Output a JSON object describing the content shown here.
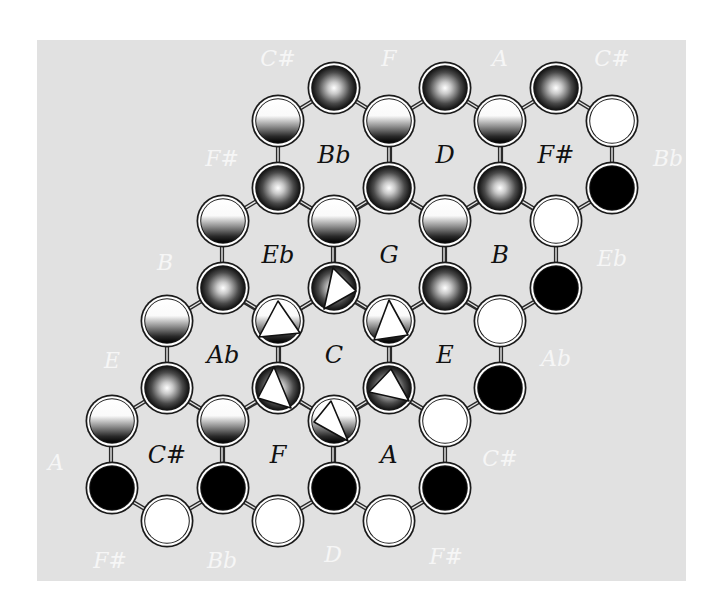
{
  "colors": {
    "panel_background": "#e1e1e1",
    "page_background": "#ffffff",
    "inner_label": "#111111",
    "outer_label": "#f6f6f6",
    "ball_outline": "#1a1a1a",
    "connector": "#2a2a2a"
  },
  "lattice": {
    "dx": 55.6,
    "dy_short": 33.5,
    "dy_long": 67,
    "ball_radius": 25
  },
  "cells": [
    {
      "label": "Bb",
      "x": 334,
      "y": 155
    },
    {
      "label": "D",
      "x": 445,
      "y": 155
    },
    {
      "label": "F#",
      "x": 556,
      "y": 155
    },
    {
      "label": "Eb",
      "x": 278,
      "y": 255
    },
    {
      "label": "G",
      "x": 389,
      "y": 255
    },
    {
      "label": "B",
      "x": 500,
      "y": 255
    },
    {
      "label": "Ab",
      "x": 223,
      "y": 355
    },
    {
      "label": "C",
      "x": 334,
      "y": 355
    },
    {
      "label": "E",
      "x": 445,
      "y": 355
    },
    {
      "label": "C#",
      "x": 167,
      "y": 455
    },
    {
      "label": "F",
      "x": 278,
      "y": 455
    },
    {
      "label": "A",
      "x": 389,
      "y": 455
    }
  ],
  "outer_labels": [
    {
      "label": "C#",
      "x": 278,
      "y": 58
    },
    {
      "label": "F",
      "x": 389,
      "y": 58
    },
    {
      "label": "A",
      "x": 500,
      "y": 58
    },
    {
      "label": "C#",
      "x": 612,
      "y": 58
    },
    {
      "label": "F#",
      "x": 222,
      "y": 158
    },
    {
      "label": "Bb",
      "x": 668,
      "y": 158
    },
    {
      "label": "B",
      "x": 165,
      "y": 262
    },
    {
      "label": "Eb",
      "x": 612,
      "y": 258
    },
    {
      "label": "E",
      "x": 112,
      "y": 360
    },
    {
      "label": "Ab",
      "x": 556,
      "y": 358
    },
    {
      "label": "A",
      "x": 56,
      "y": 462
    },
    {
      "label": "C#",
      "x": 500,
      "y": 458
    },
    {
      "label": "F#",
      "x": 110,
      "y": 560
    },
    {
      "label": "Bb",
      "x": 222,
      "y": 560
    },
    {
      "label": "D",
      "x": 333,
      "y": 554
    },
    {
      "label": "F#",
      "x": 446,
      "y": 556
    }
  ],
  "ball_types": {
    "radial": "dark sphere (radial gradient white center to black edge)",
    "linear": "half-shaded (linear gradient white top to black bottom)",
    "white": "solid white",
    "black": "solid black",
    "radial-tri": "dark sphere with white triangle marker",
    "linear-tri": "half-shaded with white triangle marker"
  },
  "balls": [
    {
      "x": 334,
      "y": 88,
      "type": "radial"
    },
    {
      "x": 445,
      "y": 88,
      "type": "radial"
    },
    {
      "x": 556,
      "y": 88,
      "type": "radial"
    },
    {
      "x": 278,
      "y": 121,
      "type": "linear"
    },
    {
      "x": 389,
      "y": 121,
      "type": "linear"
    },
    {
      "x": 500,
      "y": 121,
      "type": "linear"
    },
    {
      "x": 612,
      "y": 121,
      "type": "white"
    },
    {
      "x": 278,
      "y": 188,
      "type": "radial"
    },
    {
      "x": 389,
      "y": 188,
      "type": "radial"
    },
    {
      "x": 500,
      "y": 188,
      "type": "radial"
    },
    {
      "x": 612,
      "y": 188,
      "type": "black"
    },
    {
      "x": 223,
      "y": 221,
      "type": "linear"
    },
    {
      "x": 334,
      "y": 221,
      "type": "linear"
    },
    {
      "x": 445,
      "y": 221,
      "type": "linear"
    },
    {
      "x": 556,
      "y": 221,
      "type": "white"
    },
    {
      "x": 223,
      "y": 288,
      "type": "radial"
    },
    {
      "x": 334,
      "y": 288,
      "type": "radial-tri",
      "tri": [
        [
          -1,
          -20
        ],
        [
          22,
          3
        ],
        [
          -10,
          21
        ]
      ]
    },
    {
      "x": 445,
      "y": 288,
      "type": "radial"
    },
    {
      "x": 556,
      "y": 288,
      "type": "black"
    },
    {
      "x": 167,
      "y": 321,
      "type": "linear"
    },
    {
      "x": 278,
      "y": 321,
      "type": "linear-tri",
      "tri": [
        [
          0,
          -20
        ],
        [
          22,
          12
        ],
        [
          -19,
          16
        ]
      ]
    },
    {
      "x": 389,
      "y": 321,
      "type": "linear-tri",
      "tri": [
        [
          0,
          -21
        ],
        [
          19,
          14
        ],
        [
          -15,
          19
        ]
      ]
    },
    {
      "x": 500,
      "y": 321,
      "type": "white"
    },
    {
      "x": 167,
      "y": 388,
      "type": "radial"
    },
    {
      "x": 278,
      "y": 388,
      "type": "radial-tri",
      "tri": [
        [
          -4,
          -21
        ],
        [
          13,
          20
        ],
        [
          -20,
          10
        ]
      ]
    },
    {
      "x": 389,
      "y": 388,
      "type": "radial-tri",
      "tri": [
        [
          2,
          -19
        ],
        [
          20,
          13
        ],
        [
          -20,
          4
        ]
      ]
    },
    {
      "x": 500,
      "y": 388,
      "type": "black"
    },
    {
      "x": 112,
      "y": 421,
      "type": "linear"
    },
    {
      "x": 223,
      "y": 421,
      "type": "linear"
    },
    {
      "x": 334,
      "y": 421,
      "type": "linear-tri",
      "tri": [
        [
          -3,
          -20
        ],
        [
          14,
          20
        ],
        [
          -20,
          1
        ]
      ]
    },
    {
      "x": 445,
      "y": 421,
      "type": "white"
    },
    {
      "x": 112,
      "y": 488,
      "type": "black"
    },
    {
      "x": 223,
      "y": 488,
      "type": "black"
    },
    {
      "x": 334,
      "y": 488,
      "type": "black"
    },
    {
      "x": 445,
      "y": 488,
      "type": "black"
    },
    {
      "x": 167,
      "y": 521,
      "type": "white"
    },
    {
      "x": 278,
      "y": 521,
      "type": "white"
    },
    {
      "x": 389,
      "y": 521,
      "type": "white"
    }
  ]
}
